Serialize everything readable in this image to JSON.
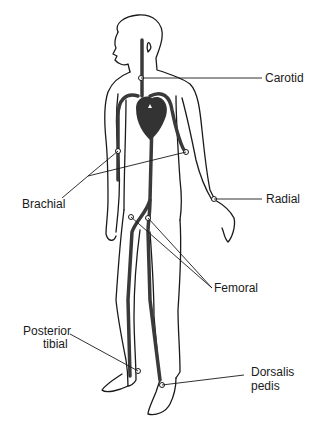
{
  "diagram": {
    "colors": {
      "outline": "#1a1a1a",
      "artery": "#3a3a3a",
      "heart": "#333333",
      "background": "#ffffff"
    },
    "labels": {
      "carotid": "Carotid",
      "brachial": "Brachial",
      "radial": "Radial",
      "femoral": "Femoral",
      "posterior_tibial_line1": "Posterior",
      "posterior_tibial_line2": "tibial",
      "dorsalis_pedis_line1": "Dorsalis",
      "dorsalis_pedis_line2": "pedis"
    }
  }
}
